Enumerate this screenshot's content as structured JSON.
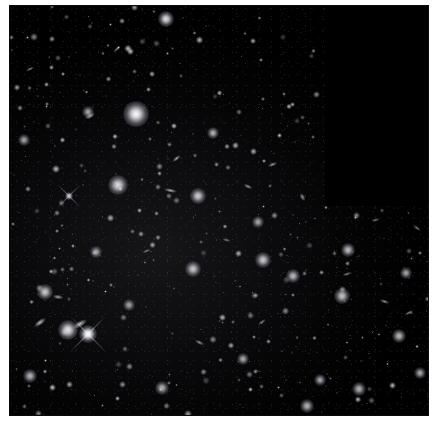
{
  "page": {
    "background_color": "#ffffff",
    "caption": ""
  },
  "plate": {
    "name": "deep-field-image",
    "alt_text": "Deep field astronomical exposure showing thousands of faint distant galaxies on a black sky background",
    "frame_color": "#000000",
    "sky_color": "#000000",
    "source_color": "#ffffff",
    "x": 10,
    "y": 6,
    "width": 418,
    "height": 409,
    "footprint_note": "Upper-right region un-exposed (pure black), step boundary at approximately x=315, y=200"
  },
  "chart_data": {
    "type": "scatter",
    "subtitle": "",
    "xlabel": "",
    "ylabel": "",
    "xlim": [
      0,
      418
    ],
    "ylim": [
      0,
      409
    ],
    "grid": false,
    "legend": "none",
    "annotations": [
      "Un-exposed chevron notch occupies the upper-right corner of the frame",
      "Field densely populated with faint resolved galaxies and unresolved point sources"
    ],
    "series": [
      {
        "name": "bright-galaxies",
        "marker": "fuzzy-disk",
        "points": [
          {
            "x": 126,
            "y": 108,
            "r": 13,
            "b": 1.0
          },
          {
            "x": 58,
            "y": 324,
            "r": 10,
            "b": 0.92
          },
          {
            "x": 108,
            "y": 179,
            "r": 10,
            "b": 0.88
          },
          {
            "x": 188,
            "y": 190,
            "r": 8,
            "b": 0.82
          },
          {
            "x": 78,
            "y": 328,
            "r": 9,
            "b": 0.9
          },
          {
            "x": 35,
            "y": 286,
            "r": 8,
            "b": 0.8
          },
          {
            "x": 183,
            "y": 263,
            "r": 8,
            "b": 0.78
          },
          {
            "x": 253,
            "y": 254,
            "r": 8,
            "b": 0.8
          },
          {
            "x": 332,
            "y": 290,
            "r": 8,
            "b": 0.78
          },
          {
            "x": 283,
            "y": 270,
            "r": 7,
            "b": 0.74
          },
          {
            "x": 338,
            "y": 244,
            "r": 7,
            "b": 0.76
          },
          {
            "x": 389,
            "y": 330,
            "r": 7,
            "b": 0.74
          },
          {
            "x": 349,
            "y": 383,
            "r": 7,
            "b": 0.72
          },
          {
            "x": 297,
            "y": 400,
            "r": 7,
            "b": 0.72
          },
          {
            "x": 152,
            "y": 382,
            "r": 7,
            "b": 0.7
          },
          {
            "x": 233,
            "y": 353,
            "r": 6,
            "b": 0.68
          },
          {
            "x": 86,
            "y": 246,
            "r": 6,
            "b": 0.68
          },
          {
            "x": 20,
            "y": 370,
            "r": 7,
            "b": 0.72
          },
          {
            "x": 203,
            "y": 127,
            "r": 6,
            "b": 0.7
          },
          {
            "x": 78,
            "y": 106,
            "r": 6,
            "b": 0.66
          },
          {
            "x": 14,
            "y": 134,
            "r": 6,
            "b": 0.66
          },
          {
            "x": 156,
            "y": 13,
            "r": 8,
            "b": 0.9
          },
          {
            "x": 410,
            "y": 367,
            "r": 6,
            "b": 0.68
          },
          {
            "x": 248,
            "y": 216,
            "r": 6,
            "b": 0.66
          },
          {
            "x": 310,
            "y": 374,
            "r": 6,
            "b": 0.66
          },
          {
            "x": 119,
            "y": 299,
            "r": 6,
            "b": 0.64
          },
          {
            "x": 396,
            "y": 267,
            "r": 6,
            "b": 0.66
          }
        ]
      },
      {
        "name": "elongated-galaxies",
        "marker": "ellipse",
        "points": [
          {
            "x": 80,
            "y": 110,
            "w": 14,
            "h": 6,
            "rot": -28,
            "b": 0.7
          },
          {
            "x": 160,
            "y": 184,
            "w": 17,
            "h": 5,
            "rot": 12,
            "b": 0.72
          },
          {
            "x": 166,
            "y": 152,
            "w": 13,
            "h": 5,
            "rot": -38,
            "b": 0.66
          },
          {
            "x": 238,
            "y": 180,
            "w": 12,
            "h": 5,
            "rot": 22,
            "b": 0.62
          },
          {
            "x": 262,
            "y": 158,
            "w": 13,
            "h": 5,
            "rot": -20,
            "b": 0.62
          },
          {
            "x": 30,
            "y": 316,
            "w": 18,
            "h": 7,
            "rot": -36,
            "b": 0.78
          },
          {
            "x": 70,
            "y": 318,
            "w": 20,
            "h": 8,
            "rot": -30,
            "b": 0.8
          },
          {
            "x": 48,
            "y": 291,
            "w": 14,
            "h": 6,
            "rot": 8,
            "b": 0.66
          },
          {
            "x": 107,
            "y": 43,
            "w": 12,
            "h": 4,
            "rot": -42,
            "b": 0.58
          },
          {
            "x": 20,
            "y": 63,
            "w": 12,
            "h": 4,
            "rot": -25,
            "b": 0.56
          },
          {
            "x": 374,
            "y": 295,
            "w": 13,
            "h": 5,
            "rot": 18,
            "b": 0.6
          },
          {
            "x": 337,
            "y": 268,
            "w": 12,
            "h": 4,
            "rot": -16,
            "b": 0.58
          },
          {
            "x": 189,
            "y": 336,
            "w": 13,
            "h": 5,
            "rot": 26,
            "b": 0.6
          },
          {
            "x": 252,
            "y": 316,
            "w": 12,
            "h": 4,
            "rot": -34,
            "b": 0.56
          },
          {
            "x": 216,
            "y": 234,
            "w": 11,
            "h": 4,
            "rot": 14,
            "b": 0.54
          },
          {
            "x": 365,
            "y": 214,
            "w": 11,
            "h": 4,
            "rot": -12,
            "b": 0.54
          },
          {
            "x": 407,
            "y": 222,
            "w": 12,
            "h": 4,
            "rot": 36,
            "b": 0.56
          },
          {
            "x": 136,
            "y": 245,
            "w": 11,
            "h": 4,
            "rot": -22,
            "b": 0.52
          },
          {
            "x": 292,
            "y": 191,
            "w": 11,
            "h": 6,
            "rot": 58,
            "b": 0.62
          },
          {
            "x": 398,
            "y": 307,
            "w": 11,
            "h": 4,
            "rot": -28,
            "b": 0.54
          }
        ]
      },
      {
        "name": "bright-stars-with-spikes",
        "marker": "spiked",
        "points": [
          {
            "x": 78,
            "y": 328,
            "r": 6,
            "b": 1.0
          },
          {
            "x": 59,
            "y": 190,
            "r": 4,
            "b": 0.8
          }
        ]
      },
      {
        "name": "point-sources",
        "marker": "point",
        "count": 260,
        "note": "Faint unresolved point sources distributed across the exposed footprint"
      }
    ]
  }
}
